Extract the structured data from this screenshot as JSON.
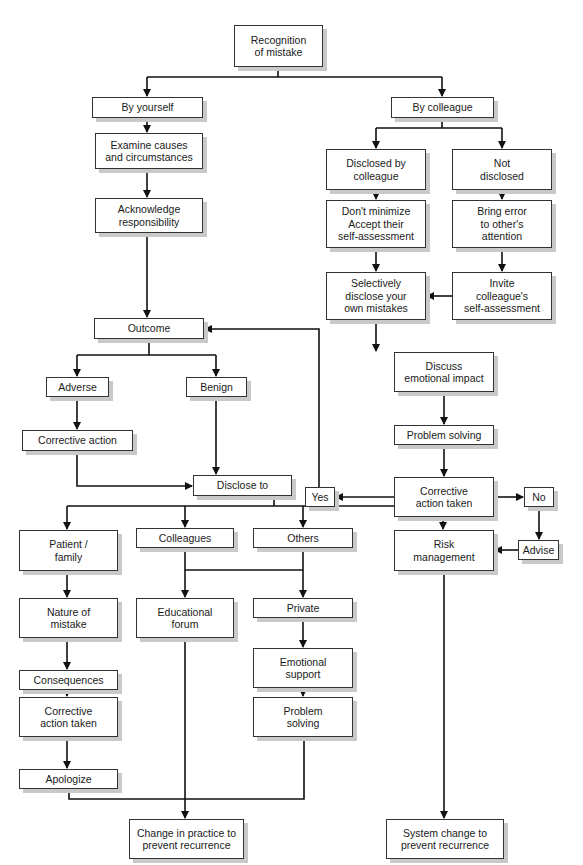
{
  "diagram": {
    "type": "flowchart",
    "nodes": {
      "recognition": "Recognition\nof mistake",
      "by_yourself": "By yourself",
      "by_colleague": "By colleague",
      "examine": "Examine causes\nand circumstances",
      "acknowledge": "Acknowledge\nresponsibility",
      "disclosed_by_colleague": "Disclosed by\ncolleague",
      "not_disclosed": "Not\ndisclosed",
      "dont_minimize": "Don't minimize\nAccept their\nself-assessment",
      "bring_error": "Bring error\nto other's\nattention",
      "selectively_disclose": "Selectively\ndisclose your\nown mistakes",
      "invite_colleague": "Invite\ncolleague's\nself-assessment",
      "outcome": "Outcome",
      "adverse": "Adverse",
      "benign": "Benign",
      "corrective_action": "Corrective action",
      "discuss_emotional": "Discuss\nemotional impact",
      "problem_solving_right": "Problem solving",
      "corrective_taken_right": "Corrective\naction taken",
      "yes": "Yes",
      "no": "No",
      "disclose_to": "Disclose to",
      "patient_family": "Patient /\nfamily",
      "colleagues": "Colleagues",
      "others": "Others",
      "risk_management": "Risk\nmanagement",
      "advise": "Advise",
      "nature_of_mistake": "Nature of\nmistake",
      "educational_forum": "Educational\nforum",
      "private": "Private",
      "emotional_support": "Emotional\nsupport",
      "consequences": "Consequences",
      "corrective_taken_left": "Corrective\naction taken",
      "problem_solving_bottom": "Problem\nsolving",
      "apologize": "Apologize",
      "change_in_practice": "Change in practice to\nprevent recurrence",
      "system_change": "System change to\nprevent recurrence"
    },
    "colors": {
      "line": "#111111",
      "border": "#333333",
      "shadow": "#c9c9c9"
    }
  }
}
